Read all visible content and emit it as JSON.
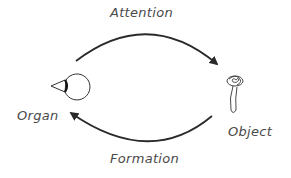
{
  "diagram": {
    "type": "cycle",
    "nodes": [
      {
        "id": "organ",
        "label": "Organ",
        "icon": "eye-icon"
      },
      {
        "id": "object",
        "label": "Object",
        "icon": "flower-icon"
      }
    ],
    "edges": [
      {
        "from": "organ",
        "to": "object",
        "label": "Attention"
      },
      {
        "from": "object",
        "to": "organ",
        "label": "Formation"
      }
    ]
  },
  "colors": {
    "stroke": "#2a2a2a",
    "text": "#4a4a4a",
    "background": "#ffffff"
  }
}
